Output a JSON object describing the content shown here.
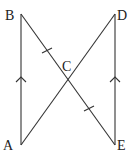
{
  "diagram": {
    "type": "geometry",
    "points": {
      "A": {
        "label": "A",
        "x": 21,
        "y": 145,
        "lx": 3,
        "ly": 150
      },
      "B": {
        "label": "B",
        "x": 21,
        "y": 14,
        "lx": 5,
        "ly": 20
      },
      "C": {
        "label": "C",
        "x": 68,
        "y": 79,
        "lx": 62,
        "ly": 71
      },
      "D": {
        "label": "D",
        "x": 115,
        "y": 14,
        "lx": 117,
        "ly": 20
      },
      "E": {
        "label": "E",
        "x": 115,
        "y": 145,
        "lx": 117,
        "ly": 150
      }
    },
    "segments": [
      "AB",
      "DE",
      "BE",
      "AD"
    ],
    "annotations": {
      "parallel_arrows": [
        "AB",
        "ED"
      ],
      "equal_ticks": [
        "BC",
        "CE"
      ]
    },
    "colors": {
      "line": "#333333",
      "text": "#222222",
      "background": "#ffffff"
    }
  }
}
